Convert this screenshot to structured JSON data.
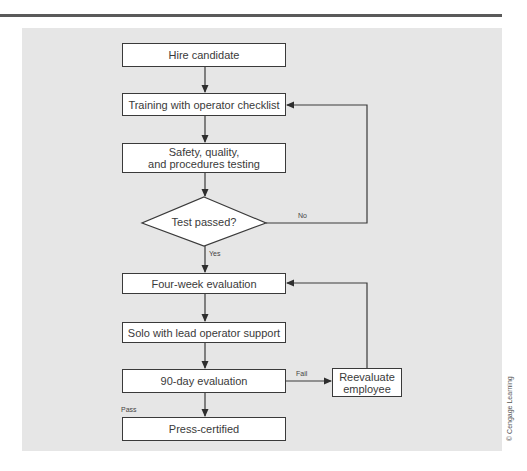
{
  "diagram": {
    "type": "flowchart",
    "nodes": {
      "hire": {
        "label": "Hire candidate"
      },
      "training": {
        "label": "Training with operator checklist"
      },
      "testing": {
        "lines": [
          "Safety, quality,",
          "and procedures testing"
        ]
      },
      "decision": {
        "label": "Test passed?"
      },
      "four_week": {
        "label": "Four-week evaluation"
      },
      "solo": {
        "label": "Solo with lead operator support"
      },
      "ninety_day": {
        "label": "90-day evaluation"
      },
      "reevaluate": {
        "lines": [
          "Reevaluate",
          "employee"
        ]
      },
      "certified": {
        "label": "Press-certified"
      }
    },
    "edge_labels": {
      "no": "No",
      "yes": "Yes",
      "fail": "Fail",
      "pass": "Pass"
    },
    "edges": [
      {
        "from": "Hire candidate",
        "to": "Training with operator checklist"
      },
      {
        "from": "Training with operator checklist",
        "to": "Safety, quality, and procedures testing"
      },
      {
        "from": "Safety, quality, and procedures testing",
        "to": "Test passed?"
      },
      {
        "from": "Test passed?",
        "to": "Training with operator checklist",
        "label": "No"
      },
      {
        "from": "Test passed?",
        "to": "Four-week evaluation",
        "label": "Yes"
      },
      {
        "from": "Four-week evaluation",
        "to": "Solo with lead operator support"
      },
      {
        "from": "Solo with lead operator support",
        "to": "90-day evaluation"
      },
      {
        "from": "90-day evaluation",
        "to": "Reevaluate employee",
        "label": "Fail"
      },
      {
        "from": "Reevaluate employee",
        "to": "Four-week evaluation"
      },
      {
        "from": "90-day evaluation",
        "to": "Press-certified",
        "label": "Pass"
      }
    ],
    "credit": "© Cengage Learning"
  },
  "colors": {
    "panel": "#e6e6e6",
    "box_fill": "#ffffff",
    "stroke": "#3a3a3a",
    "rule": "#5a5a5a"
  }
}
